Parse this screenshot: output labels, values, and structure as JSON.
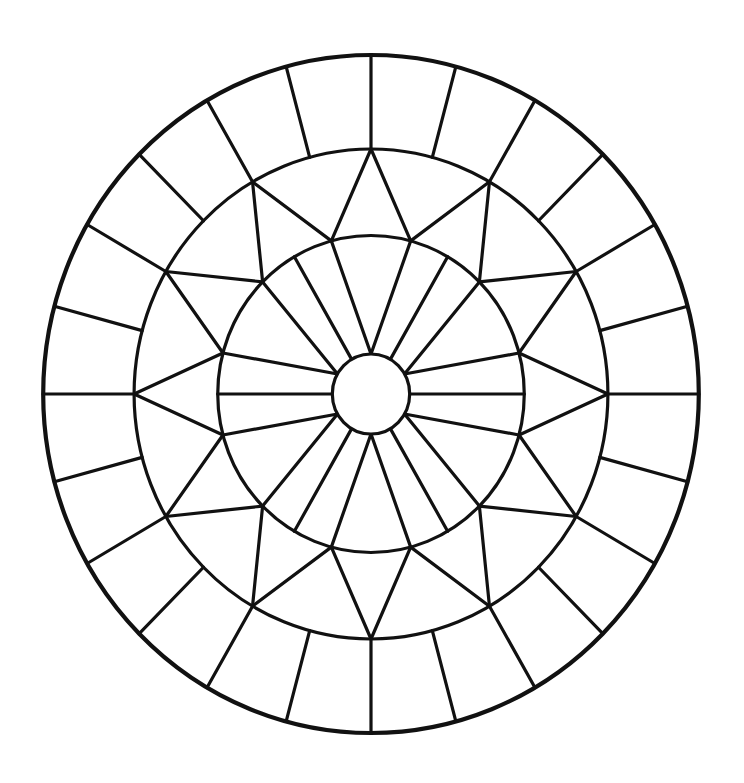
{
  "diagram": {
    "type": "radial-line-art",
    "background": "#ffffff",
    "stroke_color": "#111111",
    "center": {
      "x": 371,
      "y": 394
    },
    "x_scale": 0.967,
    "rings": {
      "outer_radius": 339,
      "middle_radius": 245,
      "inner_radius": 158.5,
      "hub_radius": 40
    },
    "stroke_widths": {
      "outer_circle": 4.2,
      "default": 3.2
    },
    "outer_ring": {
      "description": "Band between middle and outer circle divided by radial spokes",
      "spoke_step_deg": 15,
      "spoke_count": 24
    },
    "middle_ring": {
      "description": "Zigzag star: middle-circle points every 30° joined to inner-circle points offset by 15°",
      "middle_points_step_deg": 30,
      "inner_points_offset_deg": 15,
      "point_count": 12
    },
    "inner_disk": {
      "description": "Triangles converging on hub at 0°, 60°, 120°, 180°, 240°, 300°; radial lines at 30°, 90°, 150°, 210°, 270°, 330°",
      "v_apex_angles_deg": [
        0,
        60,
        120,
        180,
        240,
        300
      ],
      "radial_angles_deg": [
        30,
        90,
        150,
        210,
        270,
        330
      ]
    }
  }
}
